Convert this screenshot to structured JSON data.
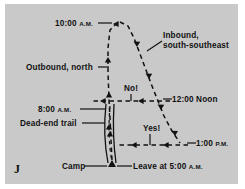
{
  "figure": {
    "letter": "J",
    "panel_color": "#c9c9c9",
    "ink_color": "#111111",
    "background_color": "#ffffff"
  },
  "labels": {
    "time_10am": "10:00",
    "time_10am_suffix": "A.M.",
    "outbound": "Outbound, north",
    "time_8am": "8:00",
    "time_8am_suffix": "A.M.",
    "dead_end": "Dead-end trail",
    "camp": "Camp",
    "leave": "Leave at 5:00",
    "leave_suffix": "A.M.",
    "inbound_line1": "Inbound,",
    "inbound_line2": "south-southeast",
    "time_noon": "12:00 Noon",
    "time_1pm": "1:00",
    "time_1pm_suffix": "P.M.",
    "marker_no": "No!",
    "marker_yes": "Yes!"
  }
}
